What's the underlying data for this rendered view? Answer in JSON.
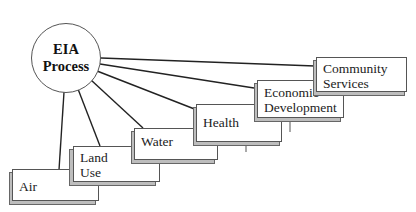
{
  "diagram": {
    "hub": {
      "line1": "EIA",
      "line2": "Process"
    },
    "nodes": [
      {
        "id": "air",
        "line1": "Air",
        "line2": ""
      },
      {
        "id": "land-use",
        "line1": "Land",
        "line2": "Use"
      },
      {
        "id": "water",
        "line1": "Water",
        "line2": ""
      },
      {
        "id": "health",
        "line1": "Health",
        "line2": ""
      },
      {
        "id": "economic-development",
        "line1": "Economic",
        "line2": "Development"
      },
      {
        "id": "community-services",
        "line1": "Community",
        "line2": "Services"
      }
    ]
  },
  "colors": {
    "line": "#222222",
    "border": "#555555",
    "shadow": "#bdbdbd"
  }
}
